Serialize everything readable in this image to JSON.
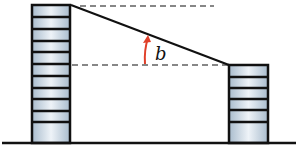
{
  "diagram": {
    "angle_label": "b",
    "colors": {
      "line": "#111111",
      "arrow": "#e0402a",
      "building_fill_light": "#eef3f8",
      "building_fill_dark": "#a9bccd"
    },
    "tall_building": {
      "floors": 11
    },
    "short_building": {
      "floors": 6
    }
  }
}
